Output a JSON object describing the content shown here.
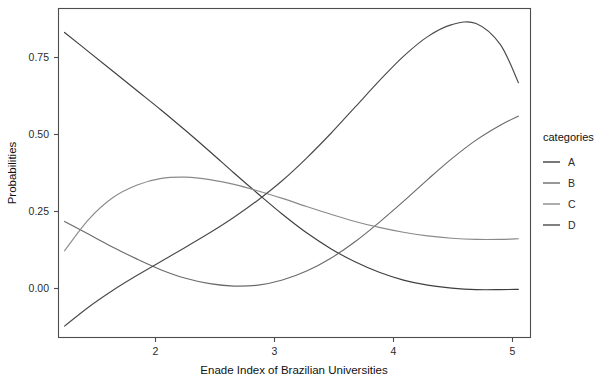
{
  "chart_data": {
    "type": "line",
    "title": "",
    "xlabel": "Enade Index of Brazilian Universities",
    "ylabel": "Probabilities",
    "xlim": [
      1.25,
      5.15
    ],
    "ylim": [
      -0.18,
      0.92
    ],
    "xticks": [
      2,
      3,
      4,
      5
    ],
    "xticklabels": [
      "2",
      "3",
      "4",
      "5"
    ],
    "yticks": [
      0.0,
      0.25,
      0.5,
      0.75
    ],
    "yticklabels": [
      "0.00",
      "0.25",
      "0.50",
      "0.75"
    ],
    "grid": false,
    "legend": {
      "title": "categories",
      "position": "right",
      "entries": [
        {
          "label": "A",
          "color": "#3f3f3f"
        },
        {
          "label": "B",
          "color": "#6b6b6b"
        },
        {
          "label": "C",
          "color": "#8a8a8a"
        },
        {
          "label": "D",
          "color": "#4a4a4a"
        }
      ]
    },
    "series": [
      {
        "name": "A",
        "color": "#3f3f3f",
        "x": [
          1.3,
          1.5,
          1.7,
          1.9,
          2.1,
          2.3,
          2.5,
          2.7,
          2.9,
          3.1,
          3.3,
          3.5,
          3.7,
          3.9,
          4.1,
          4.3,
          4.5,
          4.7,
          4.9,
          5.05
        ],
        "y": [
          0.84,
          0.775,
          0.71,
          0.645,
          0.58,
          0.512,
          0.442,
          0.37,
          0.3,
          0.232,
          0.17,
          0.117,
          0.073,
          0.038,
          0.012,
          -0.005,
          -0.015,
          -0.02,
          -0.02,
          -0.019
        ]
      },
      {
        "name": "B",
        "color": "#6b6b6b",
        "x": [
          1.3,
          1.5,
          1.7,
          1.9,
          2.1,
          2.3,
          2.5,
          2.7,
          2.9,
          3.1,
          3.3,
          3.5,
          3.7,
          3.9,
          4.1,
          4.3,
          4.5,
          4.7,
          4.9,
          5.05
        ],
        "y": [
          0.208,
          0.165,
          0.122,
          0.082,
          0.046,
          0.018,
          0.0,
          -0.008,
          -0.005,
          0.012,
          0.042,
          0.085,
          0.14,
          0.205,
          0.275,
          0.348,
          0.418,
          0.48,
          0.53,
          0.56
        ]
      },
      {
        "name": "C",
        "color": "#8a8a8a",
        "x": [
          1.3,
          1.5,
          1.7,
          1.9,
          2.1,
          2.3,
          2.5,
          2.7,
          2.9,
          3.1,
          3.3,
          3.5,
          3.7,
          3.9,
          4.1,
          4.3,
          4.5,
          4.7,
          4.9,
          5.05
        ],
        "y": [
          0.11,
          0.215,
          0.288,
          0.33,
          0.352,
          0.356,
          0.348,
          0.332,
          0.31,
          0.285,
          0.258,
          0.232,
          0.208,
          0.188,
          0.172,
          0.16,
          0.152,
          0.148,
          0.148,
          0.15
        ]
      },
      {
        "name": "D",
        "color": "#4a4a4a",
        "x": [
          1.3,
          1.5,
          1.7,
          1.9,
          2.1,
          2.3,
          2.5,
          2.7,
          2.9,
          3.1,
          3.3,
          3.5,
          3.7,
          3.9,
          4.1,
          4.3,
          4.5,
          4.7,
          4.9,
          5.05
        ],
        "y": [
          -0.142,
          -0.078,
          -0.022,
          0.028,
          0.075,
          0.122,
          0.17,
          0.222,
          0.28,
          0.345,
          0.42,
          0.502,
          0.59,
          0.678,
          0.76,
          0.826,
          0.866,
          0.87,
          0.8,
          0.672
        ]
      }
    ],
    "notes": {
      "curve_A_description": "monotonically decreasing from 0.84 to about -0.02",
      "curve_B_description": "shallow U shape, minimum near x=2.7, rising to about 0.56",
      "curve_C_description": "rises quickly to a peak near x=2.3 then declines to about 0.15",
      "curve_D_description": "U then strong rise to a peak near x=4.45 then falls to 0.67"
    }
  },
  "axes": {
    "y_title": "Probabilities",
    "x_title": "Enade Index of Brazilian Universities"
  },
  "legend": {
    "title": "categories",
    "items": [
      "A",
      "B",
      "C",
      "D"
    ]
  }
}
